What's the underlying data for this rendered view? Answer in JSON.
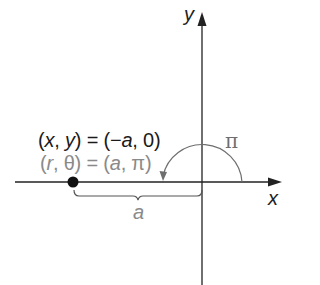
{
  "diagram": {
    "axes": {
      "x_label": "x",
      "y_label": "y"
    },
    "point": {
      "cartesian_label_prefix": "(",
      "cartesian_x": "x",
      "cartesian_sep": ", ",
      "cartesian_y": "y",
      "cartesian_eq": ") = (−",
      "cartesian_a": "a",
      "cartesian_tail": ", 0)",
      "polar_prefix": "(",
      "polar_r": "r",
      "polar_mid": ", θ) = (",
      "polar_a": "a",
      "polar_tail": ", π)",
      "cartesian_full": "(x, y) = (−a, 0)",
      "polar_full": "(r, θ) = (a, π)"
    },
    "angle_label": "π",
    "distance_label": "a",
    "colors": {
      "axis": "#222222",
      "point": "#111111",
      "cartesian_text": "#1a1a1a",
      "polar_text": "#8a8a8a",
      "arc": "#6e6e6e",
      "brace": "#555555"
    }
  }
}
